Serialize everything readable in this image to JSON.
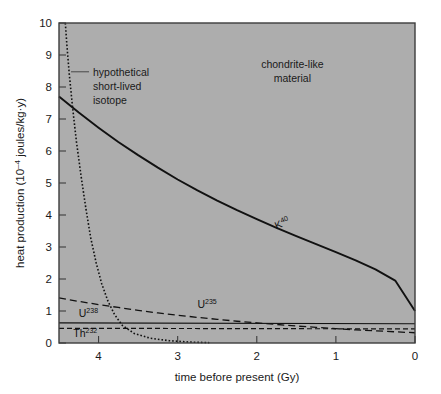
{
  "chart_data": {
    "type": "line",
    "title": "",
    "xlabel": "time before present (Gy)",
    "ylabel": "heat production (10⁻⁴ joules/kg·y)",
    "ylabel_parts": {
      "prefix": "heat production (10",
      "exponent": "–4",
      "suffix": " joules/kg·y)"
    },
    "xlim": [
      4.5,
      0
    ],
    "ylim": [
      0,
      10
    ],
    "x_ticks": [
      4,
      3,
      2,
      1,
      0
    ],
    "y_ticks": [
      0,
      1,
      2,
      3,
      4,
      5,
      6,
      7,
      8,
      9,
      10
    ],
    "x_direction": "decreasing-left-to-right",
    "grid": false,
    "legend": "inline-labels",
    "plot_bg_color": "#adadad",
    "page_bg_color": "#ffffff",
    "axis_color": "#3c3c3c",
    "curve_color": "#111111",
    "annotations": [
      {
        "name": "hypothetical-short-lived-isotope",
        "lines": [
          "hypothetical",
          "short-lived",
          "isotope"
        ],
        "x": 4.07,
        "y": 8.35,
        "leader": true
      },
      {
        "name": "chondrite-like-material",
        "lines": [
          "chondrite-like",
          "material"
        ],
        "x": 1.55,
        "y": 8.6,
        "leader": false
      }
    ],
    "series": [
      {
        "name": "K40",
        "label_base": "K",
        "label_sup": "40",
        "style": "solid",
        "label_x": 1.75,
        "label_y": 3.55,
        "label_rotate": -23,
        "x": [
          4.5,
          4.25,
          4.0,
          3.75,
          3.5,
          3.25,
          3.0,
          2.75,
          2.5,
          2.25,
          2.0,
          1.75,
          1.5,
          1.25,
          1.0,
          0.75,
          0.5,
          0.25,
          0.0
        ],
        "y": [
          7.7,
          7.2,
          6.73,
          6.28,
          5.87,
          5.48,
          5.11,
          4.77,
          4.45,
          4.15,
          3.87,
          3.6,
          3.34,
          3.09,
          2.84,
          2.58,
          2.3,
          1.95,
          1.0
        ]
      },
      {
        "name": "U235",
        "label_base": "U",
        "label_sup": "235",
        "style": "dashed-long",
        "label_x": 2.75,
        "label_y": 1.08,
        "x": [
          4.5,
          4.25,
          4.0,
          3.75,
          3.5,
          3.25,
          3.0,
          2.75,
          2.5,
          2.25,
          2.0,
          1.75,
          1.5,
          1.25,
          1.0,
          0.75,
          0.5,
          0.25,
          0.0
        ],
        "y": [
          1.41,
          1.3,
          1.2,
          1.11,
          1.02,
          0.94,
          0.87,
          0.8,
          0.74,
          0.68,
          0.63,
          0.58,
          0.53,
          0.49,
          0.45,
          0.41,
          0.38,
          0.35,
          0.32
        ]
      },
      {
        "name": "U238",
        "label_base": "U",
        "label_sup": "238",
        "style": "solid-thin",
        "label_x": 4.25,
        "label_y": 0.82,
        "x": [
          4.5,
          0.0
        ],
        "y": [
          0.63,
          0.6
        ]
      },
      {
        "name": "Th232",
        "label_base": "Th",
        "label_sup": "232",
        "style": "dashed-short",
        "label_x": 4.32,
        "label_y": 0.18,
        "x": [
          4.5,
          0.0
        ],
        "y": [
          0.46,
          0.44
        ]
      },
      {
        "name": "hypothetical-short-lived-isotope-curve",
        "label_base": "",
        "label_sup": "",
        "style": "dotted",
        "x": [
          4.42,
          4.4,
          4.37,
          4.33,
          4.28,
          4.22,
          4.16,
          4.1,
          4.03,
          3.96,
          3.88,
          3.8,
          3.7,
          3.55,
          3.35,
          3.1,
          2.85,
          2.6
        ],
        "y": [
          10.0,
          9.3,
          8.4,
          7.4,
          6.3,
          5.2,
          4.2,
          3.3,
          2.5,
          1.85,
          1.3,
          0.9,
          0.55,
          0.3,
          0.15,
          0.07,
          0.03,
          0.01
        ]
      }
    ]
  }
}
